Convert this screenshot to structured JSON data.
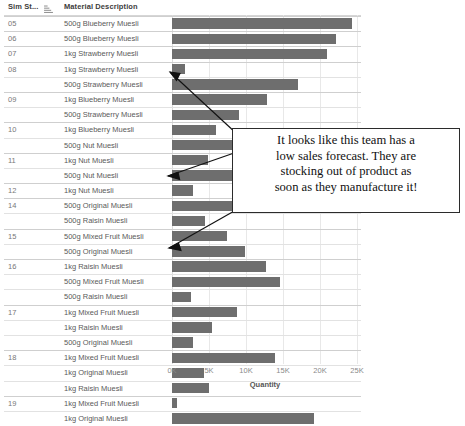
{
  "table": {
    "columns": [
      {
        "key": "sim",
        "label": "Sim St...",
        "icon": "sort-ascending-icon"
      },
      {
        "key": "material",
        "label": "Material Description"
      }
    ]
  },
  "axis": {
    "label": "Quantity",
    "ticks": [
      "0K",
      "5K",
      "10K",
      "15K",
      "20K",
      "25K"
    ],
    "tick_values": [
      0,
      5000,
      10000,
      15000,
      20000,
      25000
    ],
    "min": 0,
    "max": 26500
  },
  "annotation": {
    "line1": "It looks like this team has a",
    "line2": "low sales forecast. They are",
    "line3": "stocking out of product as",
    "line4": "soon as they manufacture it!"
  },
  "colors": {
    "bar": "#6e6e6e",
    "grid": "#e8e8e8",
    "group_separator": "#cfcfcf",
    "row_separator": "#e2e2e2",
    "header_text": "#3c3c3c",
    "sim_text": "#787878",
    "material_text": "#5a5a5a",
    "axis_text": "#8a8a8a",
    "annotation_border": "#2b2b2b"
  },
  "chart_data": {
    "type": "bar",
    "title": "",
    "xlabel": "Quantity",
    "ylabel": "",
    "xlim": [
      0,
      26500
    ],
    "grid": true,
    "orientation": "horizontal",
    "legend": "none",
    "group_field": "Sim St...",
    "category_field": "Material Description",
    "value_field": "Quantity",
    "rows": [
      {
        "sim": "05",
        "material": "500g Blueberry Muesli",
        "value": 24300,
        "group_start": true
      },
      {
        "sim": "06",
        "material": "500g Blueberry Muesli",
        "value": 22100,
        "group_start": true
      },
      {
        "sim": "07",
        "material": "1kg Strawberry Muesli",
        "value": 20900,
        "group_start": true
      },
      {
        "sim": "08",
        "material": "1kg Strawberry Muesli",
        "value": 1700,
        "group_start": true
      },
      {
        "sim": "",
        "material": "500g Strawberry Muesli",
        "value": 17000,
        "group_start": false
      },
      {
        "sim": "09",
        "material": "1kg Blueberry Muesli",
        "value": 12800,
        "group_start": true
      },
      {
        "sim": "",
        "material": "500g Strawberry Muesli",
        "value": 9000,
        "group_start": false
      },
      {
        "sim": "10",
        "material": "1kg Blueberry Muesli",
        "value": 5900,
        "group_start": true
      },
      {
        "sim": "",
        "material": "500g Nut Muesli",
        "value": 10400,
        "group_start": false
      },
      {
        "sim": "11",
        "material": "1kg Nut Muesli",
        "value": 4800,
        "group_start": true
      },
      {
        "sim": "",
        "material": "500g Nut Muesli",
        "value": 8100,
        "group_start": false
      },
      {
        "sim": "12",
        "material": "1kg Nut Muesli",
        "value": 2800,
        "group_start": true
      },
      {
        "sim": "14",
        "material": "500g Original Muesli",
        "value": 8600,
        "group_start": true
      },
      {
        "sim": "",
        "material": "500g Raisin Muesli",
        "value": 4400,
        "group_start": false
      },
      {
        "sim": "15",
        "material": "500g Mixed Fruit Muesli",
        "value": 7400,
        "group_start": true
      },
      {
        "sim": "",
        "material": "500g Original Muesli",
        "value": 9800,
        "group_start": false
      },
      {
        "sim": "16",
        "material": "1kg Raisin Muesli",
        "value": 12700,
        "group_start": true
      },
      {
        "sim": "",
        "material": "500g Mixed Fruit Muesli",
        "value": 14600,
        "group_start": false
      },
      {
        "sim": "",
        "material": "500g Raisin Muesli",
        "value": 2500,
        "group_start": false
      },
      {
        "sim": "17",
        "material": "1kg Mixed Fruit Muesli",
        "value": 8800,
        "group_start": true
      },
      {
        "sim": "",
        "material": "1kg Raisin Muesli",
        "value": 5400,
        "group_start": false
      },
      {
        "sim": "",
        "material": "500g Original Muesli",
        "value": 2800,
        "group_start": false
      },
      {
        "sim": "18",
        "material": "1kg Mixed Fruit Muesli",
        "value": 13900,
        "group_start": true
      },
      {
        "sim": "",
        "material": "1kg Original Muesli",
        "value": 4300,
        "group_start": false
      },
      {
        "sim": "",
        "material": "1kg Raisin Muesli",
        "value": 5000,
        "group_start": false
      },
      {
        "sim": "19",
        "material": "1kg Mixed Fruit Muesli",
        "value": 700,
        "group_start": true
      },
      {
        "sim": "",
        "material": "1kg Original Muesli",
        "value": 19200,
        "group_start": false
      }
    ]
  }
}
